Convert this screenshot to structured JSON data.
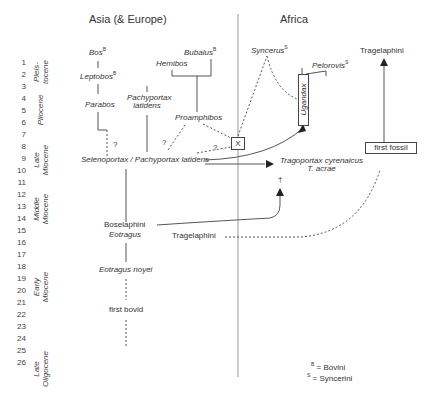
{
  "regions": {
    "left": "Asia (& Europe)",
    "right": "Africa"
  },
  "time_scale": {
    "ticks": [
      "1",
      "2",
      "3",
      "4",
      "5",
      "6",
      "7",
      "8",
      "9",
      "10",
      "11",
      "12",
      "13",
      "14",
      "15",
      "16",
      "17",
      "18",
      "19",
      "20",
      "21",
      "22",
      "23",
      "24",
      "25",
      "26"
    ],
    "unit": "million years ago"
  },
  "epochs": [
    {
      "label": "Pleis-\ntocene",
      "line1": "Pleis-",
      "line2": "tocene"
    },
    {
      "label": "Pliocene",
      "line1": "Pliocene",
      "line2": ""
    },
    {
      "label": "Late Miocene",
      "line1": "Late",
      "line2": "Miocene"
    },
    {
      "label": "Middle Miocene",
      "line1": "Middle",
      "line2": "Miocene"
    },
    {
      "label": "Early Miocene",
      "line1": "Early",
      "line2": "Miocene"
    },
    {
      "label": "Late Oligocene",
      "line1": "Late",
      "line2": "Oligocene"
    }
  ],
  "taxa": {
    "bos": "Bos",
    "leptobos": "Leptobos",
    "parabos": "Parabos",
    "bubalus": "Bubalus",
    "hemibos": "Hemibos",
    "pachyportax_1": "Pachyportax",
    "pachyportax_2": "latidens",
    "proamphibos": "Proamphibos",
    "selenoportax": "Selenoportax / Pachyportax latidens",
    "syncerus": "Syncerus",
    "pelorovis": "Pelorovis",
    "ugandax": "Ugandax",
    "x_box": "X",
    "tragoportax_1": "Tragoportax cyrenaicus",
    "tragoportax_2": "T. acrae",
    "dagger": "†",
    "tragelaphini_africa": "Tragelaphini",
    "first_fossil": "first fossil",
    "boselaphini": "Boselaphini",
    "eotragus": "Eotragus",
    "tragelaphini_asia": "Tragelaphini",
    "eotragus_noyei": "Eotragus noyei",
    "first_bovid": "first bovid",
    "question_mark": "?"
  },
  "legend": {
    "bovini": "= Bovini",
    "syncerini": "= Syncerini",
    "bovini_mark": "B",
    "syncerini_mark": "S"
  },
  "colors": {
    "line": "#555555",
    "text": "#333333",
    "background": "#ffffff"
  }
}
